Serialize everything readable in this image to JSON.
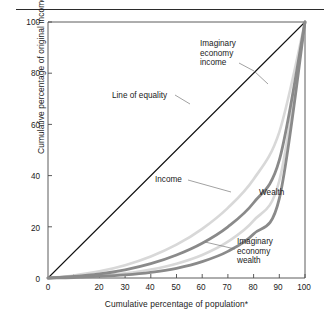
{
  "figure": {
    "name": "lorenz-curve-figure",
    "top_rule": true
  },
  "chart_data": {
    "type": "line",
    "title": "",
    "subtitle": "",
    "xlabel": "Cumulative percentage of population*",
    "ylabel": "Cumulative percentage of original income and wealth",
    "xlim": [
      0,
      100
    ],
    "ylim": [
      0,
      100
    ],
    "grid": false,
    "legend_position": "inline-annotations",
    "xticks": [
      0,
      10,
      20,
      30,
      40,
      50,
      60,
      70,
      80,
      90,
      100
    ],
    "xticklabels": [
      "0",
      "",
      "20",
      "30",
      "40",
      "50",
      "60",
      "70",
      "80",
      "90",
      "100"
    ],
    "yticks": [
      0,
      20,
      40,
      60,
      80,
      100
    ],
    "yticklabels": [
      "0",
      "20",
      "40",
      "60",
      "80",
      "100"
    ],
    "x": [
      0,
      10,
      20,
      30,
      40,
      50,
      60,
      70,
      80,
      90,
      100
    ],
    "series": [
      {
        "name": "Line of equality",
        "color": "#111111",
        "width": 1.1,
        "values": [
          0,
          10,
          20,
          30,
          40,
          50,
          60,
          70,
          80,
          90,
          100
        ]
      },
      {
        "name": "Imaginary economy income",
        "color": "#d8d8d8",
        "width": 2.6,
        "values": [
          0,
          1.0,
          2.6,
          5.0,
          8.4,
          13.0,
          19.2,
          27.4,
          38.6,
          57.0,
          100
        ]
      },
      {
        "name": "Income",
        "color": "#8a8a8a",
        "width": 2.8,
        "values": [
          0,
          0.6,
          1.6,
          3.2,
          5.6,
          9.0,
          13.6,
          20.0,
          29.4,
          46.0,
          100
        ]
      },
      {
        "name": "Imaginary economy wealth",
        "color": "#d8d8d8",
        "width": 2.6,
        "values": [
          0,
          0.3,
          0.9,
          1.8,
          3.3,
          5.6,
          9.0,
          14.2,
          22.4,
          38.0,
          100
        ]
      },
      {
        "name": "Wealth",
        "color": "#8a8a8a",
        "width": 2.8,
        "values": [
          0,
          0.2,
          0.6,
          1.2,
          2.2,
          3.8,
          6.4,
          10.4,
          17.2,
          31.0,
          100
        ]
      }
    ],
    "annotations": [
      {
        "id": "imaginary-economy-income",
        "lines": [
          "Imaginary",
          "economy",
          "income"
        ],
        "text": "Imaginary economy income"
      },
      {
        "id": "line-of-equality",
        "lines": [
          "Line of equality"
        ],
        "text": "Line of equality"
      },
      {
        "id": "income",
        "lines": [
          "Income"
        ],
        "text": "Income"
      },
      {
        "id": "wealth",
        "lines": [
          "Wealth"
        ],
        "text": "Wealth"
      },
      {
        "id": "imaginary-economy-wealth",
        "lines": [
          "Imaginary",
          "economy",
          "wealth"
        ],
        "text": "Imaginary economy wealth"
      }
    ]
  }
}
